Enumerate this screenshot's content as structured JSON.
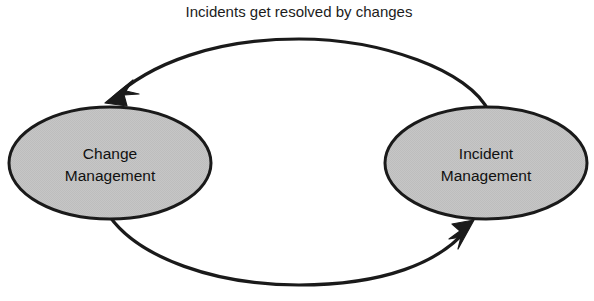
{
  "diagram": {
    "type": "cycle-diagram",
    "caption": {
      "text": "Incidents get resolved by changes"
    },
    "nodes": [
      {
        "id": "change-management",
        "line1": "Change",
        "line2": "Management",
        "shape": "ellipse",
        "fill_color": "#c4c4c4",
        "stroke_color": "#1a1a1a",
        "cx": 110,
        "cy": 163,
        "rx": 102,
        "ry": 57
      },
      {
        "id": "incident-management",
        "line1": "Incident",
        "line2": "Management",
        "shape": "ellipse",
        "fill_color": "#c4c4c4",
        "stroke_color": "#1a1a1a",
        "cx": 486,
        "cy": 163,
        "rx": 101,
        "ry": 57
      }
    ],
    "connectors": [
      {
        "id": "top-arrow",
        "from": "incident-management",
        "to": "change-management",
        "direction": "right-to-left",
        "style": "curved-arrow",
        "arrowhead": "solid-filled",
        "color": "#1a1a1a"
      },
      {
        "id": "bottom-arrow",
        "from": "change-management",
        "to": "incident-management",
        "direction": "left-to-right",
        "style": "curved-arrow",
        "arrowhead": "solid-filled",
        "color": "#1a1a1a"
      }
    ],
    "colors": {
      "background": "#ffffff",
      "node_fill": "#c4c4c4",
      "line": "#1a1a1a",
      "text": "#111111"
    }
  }
}
